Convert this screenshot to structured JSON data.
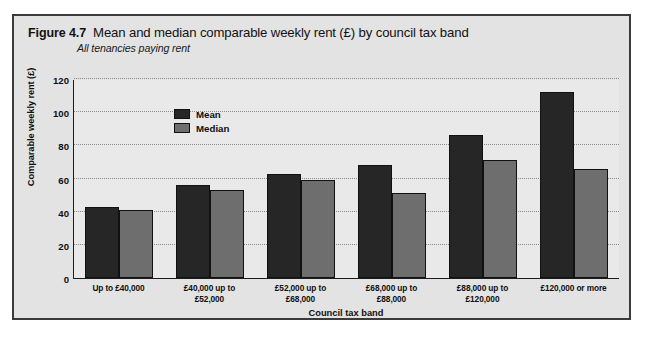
{
  "figure": {
    "number": "Figure 4.7",
    "title": "Mean and median comparable weekly rent (£) by council tax band",
    "subtitle": "All tenancies paying rent"
  },
  "colors": {
    "mean": "#262626",
    "median": "#6e6e6e",
    "panel": "#e3e3e3",
    "plot": "#e9e9e9",
    "border": "#3b3b3b"
  },
  "chart_data": {
    "type": "bar",
    "title": "Mean and median comparable weekly rent (£) by council tax band",
    "subtitle": "All tenancies paying rent",
    "xlabel": "Council tax band",
    "ylabel": "Comparable weekly rent (£)",
    "ylim": [
      0,
      120
    ],
    "yticks": [
      0,
      20,
      40,
      60,
      80,
      100,
      120
    ],
    "ytick_labels": [
      "0",
      "20",
      "40",
      "60",
      "80",
      "100",
      "120"
    ],
    "grid": true,
    "legend_position": "upper-left-inside",
    "categories": [
      "Up to £40,000",
      "£40,000  up to\n£52,000",
      "£52,000  up to\n£68,000",
      "£68,000  up to\n£88,000",
      "£88,000  up to\n£120,000",
      "£120,000 or more"
    ],
    "series": [
      {
        "name": "Mean",
        "values": [
          43,
          56,
          63,
          68,
          86,
          112
        ]
      },
      {
        "name": "Median",
        "values": [
          41,
          53,
          59,
          51,
          71,
          66
        ]
      }
    ]
  }
}
